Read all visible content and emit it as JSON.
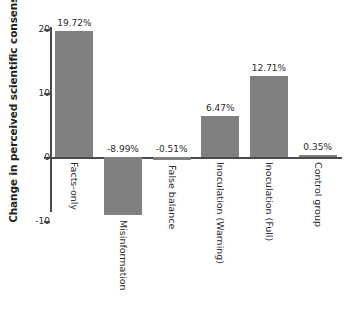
{
  "chart_data": {
    "type": "bar",
    "title": "",
    "xlabel": "",
    "ylabel": "Change in perceived scientific consensus",
    "ylim": [
      -12,
      22
    ],
    "yticks": [
      20,
      10,
      0,
      -10
    ],
    "ytick_labels": [
      "20",
      "10",
      "0",
      "-10"
    ],
    "grid": false,
    "legend": "none",
    "categories": [
      "Facts-only",
      "Misinformation",
      "False balance",
      "Inoculation (Warning)",
      "Inoculation (Full)",
      "Control group"
    ],
    "values": [
      19.72,
      -8.99,
      -0.51,
      6.47,
      12.71,
      0.35
    ],
    "value_labels": [
      "19.72%",
      "-8.99%",
      "-0.51%",
      "6.47%",
      "12.71%",
      "0.35%"
    ],
    "bar_color": "#808080",
    "axis_color": "#4a4a4a",
    "background_color": "#ffffff"
  }
}
